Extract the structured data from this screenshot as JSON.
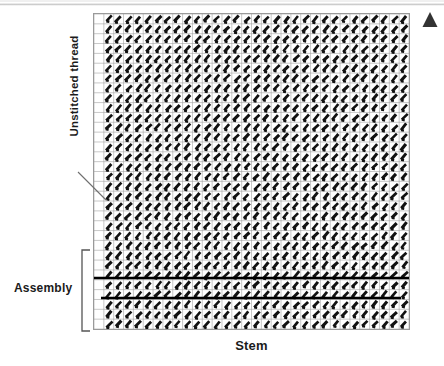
{
  "figure": {
    "background_color": "#ffffff"
  },
  "labels": {
    "x_axis": "Stem",
    "unstitched_thread": "Unstitched thread",
    "assembly": "Assembly"
  },
  "markers": {
    "north_arrow": "triangle-up",
    "north_arrow_color": "#333333"
  },
  "chart_data": {
    "type": "heatmap",
    "title": "",
    "xlabel": "Stem",
    "ylabel": "",
    "grid": true,
    "legend_position": "none",
    "grid_columns": 32,
    "grid_rows": 32,
    "cell_size_px": 9.9,
    "plot_origin_px": [
      93,
      13
    ],
    "plot_size_px": [
      317,
      317
    ],
    "empty_columns": [
      0
    ],
    "stitch_glyph": "diagonal-slash",
    "stitch_color": "#111111",
    "gridline_color": "#9a9a9a",
    "annotations": [
      {
        "name": "unstitched-thread-callout",
        "text": "Unstitched thread",
        "leader_from_px": [
          78,
          172
        ],
        "leader_to_px": [
          106,
          200
        ],
        "target": "empty left column"
      },
      {
        "name": "assembly-bracket",
        "text": "Assembly",
        "bracket_px": [
          82,
          250,
          90,
          331
        ],
        "rows_spanned": [
          25,
          32
        ]
      },
      {
        "name": "assembly-line-upper",
        "type": "horizontal-rule",
        "y_px": 277,
        "x_start_px": 93,
        "x_end_px": 410,
        "stroke_px": 2.6
      },
      {
        "name": "assembly-line-lower",
        "type": "horizontal-rule",
        "y_px": 297,
        "x_start_px": 100,
        "x_end_px": 400,
        "stroke_px": 2.6
      }
    ]
  }
}
